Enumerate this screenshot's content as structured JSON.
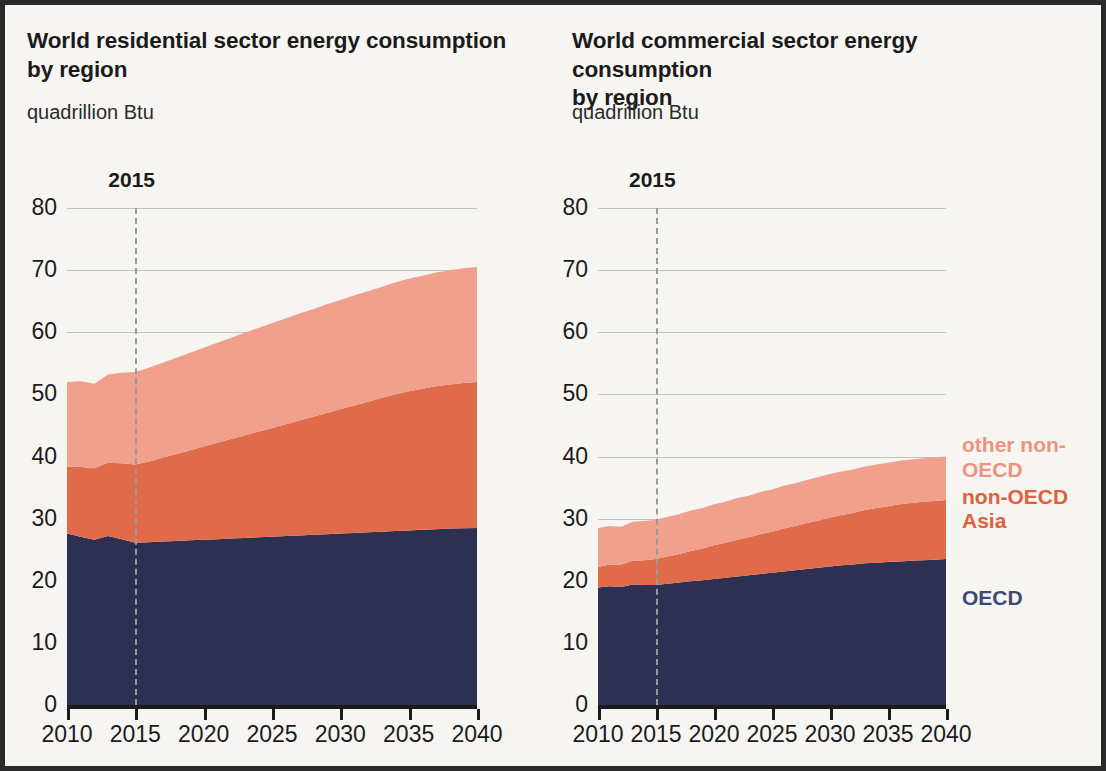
{
  "colors": {
    "other_non_oecd": "#F0A08D",
    "non_oecd_asia": "#E06B4B",
    "oecd": "#2D3050",
    "legend_light": "#EE9380",
    "legend_mid": "#E0603C",
    "legend_oecd": "#3B4A77",
    "axis": "#1b1b1b",
    "grid": "#b9b9b9",
    "marker": "#9a9a9a",
    "border": "#2a2a2a",
    "background": "#f7f5f2"
  },
  "legend": {
    "items": [
      {
        "label": "other non-OECD",
        "color": "#EE9380"
      },
      {
        "label": "non-OECD Asia",
        "color": "#E0603C"
      },
      {
        "label": "OECD",
        "color": "#3B4A77"
      }
    ],
    "other_non_oecd_line1": "other non-",
    "other_non_oecd_line2": "OECD",
    "non_oecd_asia_line1": "non-OECD",
    "non_oecd_asia_line2": "Asia",
    "oecd": "OECD"
  },
  "chart_data": [
    {
      "type": "area",
      "id": "residential",
      "title": "World residential sector energy consumption by region",
      "title_line1": "World residential sector energy consumption",
      "title_line2": "by region",
      "subtitle": "quadrillion Btu",
      "ylabel": "quadrillion Btu",
      "xlabel": "",
      "stacked": true,
      "grid": true,
      "legend_position": "right-outside",
      "marker_label": "2015",
      "marker_x": 2015,
      "xlim": [
        2010,
        2040
      ],
      "ylim": [
        0,
        80
      ],
      "yticks": [
        0,
        10,
        20,
        30,
        40,
        50,
        60,
        70,
        80
      ],
      "xticks": [
        2010,
        2015,
        2020,
        2025,
        2030,
        2035,
        2040
      ],
      "x": [
        2010,
        2011,
        2012,
        2013,
        2014,
        2015,
        2016,
        2017,
        2018,
        2019,
        2020,
        2021,
        2022,
        2023,
        2024,
        2025,
        2026,
        2027,
        2028,
        2029,
        2030,
        2031,
        2032,
        2033,
        2034,
        2035,
        2036,
        2037,
        2038,
        2039,
        2040
      ],
      "series": [
        {
          "name": "OECD",
          "color": "#2D3050",
          "values": [
            27.6,
            27.1,
            26.6,
            27.2,
            26.7,
            26.1,
            26.2,
            26.3,
            26.4,
            26.5,
            26.6,
            26.7,
            26.8,
            26.9,
            27.0,
            27.1,
            27.2,
            27.3,
            27.4,
            27.5,
            27.6,
            27.7,
            27.8,
            27.9,
            28.0,
            28.1,
            28.2,
            28.3,
            28.4,
            28.45,
            28.5
          ]
        },
        {
          "name": "non-OECD Asia",
          "color": "#E06B4B",
          "values": [
            10.8,
            11.2,
            11.5,
            11.8,
            12.2,
            12.6,
            13.0,
            13.5,
            14.0,
            14.5,
            15.0,
            15.5,
            16.0,
            16.5,
            17.0,
            17.5,
            18.0,
            18.5,
            19.0,
            19.5,
            20.0,
            20.5,
            21.0,
            21.5,
            22.0,
            22.4,
            22.7,
            23.0,
            23.2,
            23.4,
            23.5
          ]
        },
        {
          "name": "other non-OECD",
          "color": "#F0A08D",
          "values": [
            13.6,
            13.8,
            13.6,
            14.2,
            14.6,
            14.9,
            15.1,
            15.3,
            15.5,
            15.7,
            15.9,
            16.1,
            16.3,
            16.5,
            16.7,
            16.9,
            17.0,
            17.2,
            17.3,
            17.5,
            17.6,
            17.7,
            17.8,
            17.9,
            18.0,
            18.1,
            18.2,
            18.3,
            18.4,
            18.45,
            18.5
          ]
        }
      ],
      "totals": [
        52.0,
        52.1,
        51.7,
        53.2,
        53.5,
        53.6,
        54.3,
        55.1,
        55.9,
        56.7,
        57.5,
        58.3,
        59.1,
        59.9,
        60.7,
        61.5,
        62.2,
        63.0,
        63.7,
        64.5,
        65.2,
        65.9,
        66.6,
        67.3,
        68.0,
        68.6,
        69.1,
        69.6,
        70.0,
        70.3,
        70.5
      ]
    },
    {
      "type": "area",
      "id": "commercial",
      "title": "World commercial sector energy consumption by region",
      "title_line1": "World commercial sector energy consumption",
      "title_line2": "by region",
      "subtitle": "quadrillion Btu",
      "ylabel": "quadrillion Btu",
      "xlabel": "",
      "stacked": true,
      "grid": true,
      "legend_position": "right-outside",
      "marker_label": "2015",
      "marker_x": 2015,
      "xlim": [
        2010,
        2040
      ],
      "ylim": [
        0,
        80
      ],
      "yticks": [
        0,
        10,
        20,
        30,
        40,
        50,
        60,
        70,
        80
      ],
      "xticks": [
        2010,
        2015,
        2020,
        2025,
        2030,
        2035,
        2040
      ],
      "x": [
        2010,
        2011,
        2012,
        2013,
        2014,
        2015,
        2016,
        2017,
        2018,
        2019,
        2020,
        2021,
        2022,
        2023,
        2024,
        2025,
        2026,
        2027,
        2028,
        2029,
        2030,
        2031,
        2032,
        2033,
        2034,
        2035,
        2036,
        2037,
        2038,
        2039,
        2040
      ],
      "series": [
        {
          "name": "OECD",
          "color": "#2D3050",
          "values": [
            18.9,
            19.1,
            19.0,
            19.4,
            19.3,
            19.3,
            19.5,
            19.7,
            19.9,
            20.1,
            20.3,
            20.5,
            20.7,
            20.9,
            21.1,
            21.3,
            21.5,
            21.7,
            21.9,
            22.1,
            22.3,
            22.5,
            22.6,
            22.8,
            22.9,
            23.0,
            23.1,
            23.2,
            23.3,
            23.4,
            23.5
          ]
        },
        {
          "name": "non-OECD Asia",
          "color": "#E06B4B",
          "values": [
            3.3,
            3.5,
            3.6,
            3.8,
            4.0,
            4.2,
            4.4,
            4.6,
            4.9,
            5.1,
            5.4,
            5.6,
            5.9,
            6.1,
            6.4,
            6.6,
            6.9,
            7.1,
            7.4,
            7.6,
            7.9,
            8.1,
            8.3,
            8.6,
            8.8,
            9.0,
            9.2,
            9.3,
            9.4,
            9.45,
            9.5
          ]
        },
        {
          "name": "other non-OECD",
          "color": "#F0A08D",
          "values": [
            6.3,
            6.2,
            6.1,
            6.3,
            6.3,
            6.3,
            6.4,
            6.4,
            6.5,
            6.5,
            6.6,
            6.6,
            6.7,
            6.7,
            6.8,
            6.8,
            6.9,
            6.9,
            6.9,
            7.0,
            7.0,
            7.0,
            7.0,
            7.0,
            7.0,
            7.0,
            7.0,
            7.0,
            7.0,
            7.0,
            7.0
          ]
        }
      ],
      "totals": [
        28.5,
        28.8,
        28.7,
        29.5,
        29.6,
        29.8,
        30.3,
        30.7,
        31.3,
        31.7,
        32.3,
        32.7,
        33.3,
        33.7,
        34.3,
        34.7,
        35.3,
        35.7,
        36.2,
        36.7,
        37.2,
        37.6,
        37.9,
        38.4,
        38.7,
        39.0,
        39.3,
        39.5,
        39.7,
        39.85,
        40.0
      ]
    }
  ]
}
